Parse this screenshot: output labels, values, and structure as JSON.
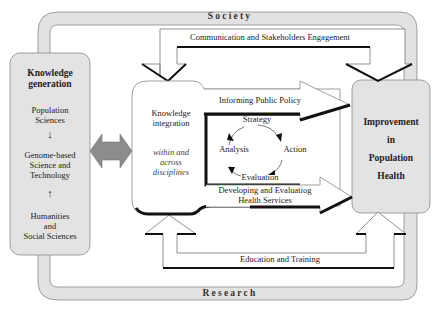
{
  "frame": {
    "top_label": "Society",
    "bottom_label": "Research",
    "band_color": "#e2e2e2",
    "stroke_color": "#8a8a8a"
  },
  "left_box": {
    "title_line1": "Knowledge",
    "title_line2": "generation",
    "items": [
      {
        "lines": [
          "Population",
          "Sciences"
        ]
      },
      {
        "lines": [
          "Genome-based",
          "Science and",
          "Technology"
        ]
      },
      {
        "lines": [
          "Humanities",
          "and",
          "Social Sciences"
        ]
      }
    ],
    "arrow_down": "↓",
    "arrow_up": "↑",
    "fill": "#e3e3e3"
  },
  "bidirectional_arrow": {
    "fill": "#8c8c8c"
  },
  "center_box": {
    "title_line1": "Knowledge",
    "title_line2": "integration",
    "subtitle_line1": "within and",
    "subtitle_line2": "across",
    "subtitle_line3": "disciplines"
  },
  "cycle": {
    "top": "Strategy",
    "right": "Action",
    "bottom": "Evaluation",
    "left": "Analysis"
  },
  "arrows": {
    "policy": "Informing Public Policy",
    "services_line1": "Developing and Evaluatiog",
    "services_line2": "Health Services",
    "communication": "Communication and Stakeholders Engagement",
    "education": "Education and Training"
  },
  "right_box": {
    "line1": "Improvement",
    "line2": "in",
    "line3": "Population",
    "line4": "Health",
    "fill": "#e3e3e3"
  }
}
